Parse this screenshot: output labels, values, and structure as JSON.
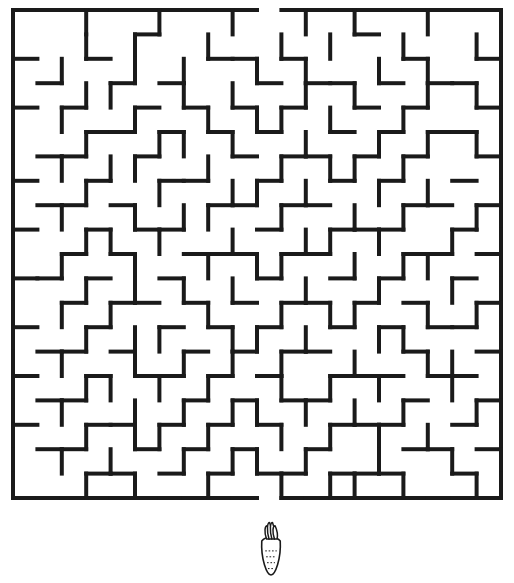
{
  "page": {
    "background_color": "#ffffff",
    "width": 514,
    "height": 583
  },
  "maze": {
    "name": "rabbit-carrot-maze",
    "wall_color": "#1a1a1a",
    "wall_thickness": 4,
    "cols": 20,
    "rows": 20,
    "origin_x": 13,
    "origin_y": 10,
    "cell_size": 24.4,
    "entrance": {
      "side": "top",
      "col": 10,
      "label": "start"
    },
    "exit": {
      "side": "bottom",
      "col": 10,
      "label": "finish"
    },
    "h_walls": [
      "11111111110111111111",
      "00000100000000100000",
      "10010000110100001001",
      "01001010001011010110",
      "10100101010100101001",
      "00011010101001010110",
      "01100100010110101001",
      "10010011001001010010",
      "01101000110110001101",
      "10010110001001110010",
      "00101001110110001101",
      "11010010001001010010",
      "00101101010110101001",
      "10010010101001010110",
      "01101001010110001001",
      "10010110101001110110",
      "01100001010110001001",
      "10011010101001110010",
      "01100101010010001101",
      "00011010101101110010",
      "11111111110111111111"
    ],
    "v_walls": [
      "100100100100101001001",
      "100101001001010010011",
      "101001010010100101001",
      "100110010100101001011",
      "101001001011010010001",
      "100100110100100101011",
      "101011001001011010001",
      "100100100110100101001",
      "101001011001001010011",
      "100110100100110100101",
      "101001001011001011001",
      "100101010100100100101",
      "101010001001011001011",
      "100101100110100110001",
      "101001010101001001101",
      "100110101001010100101",
      "101001010110101010011",
      "100101101001010101001",
      "101010010110100100101",
      "100101001001011010011"
    ]
  },
  "carrot": {
    "name": "carrot-goal-icon",
    "label": "carrot",
    "x": 271,
    "y": 525,
    "width": 28,
    "height": 50,
    "outline_color": "#1a1a1a"
  }
}
